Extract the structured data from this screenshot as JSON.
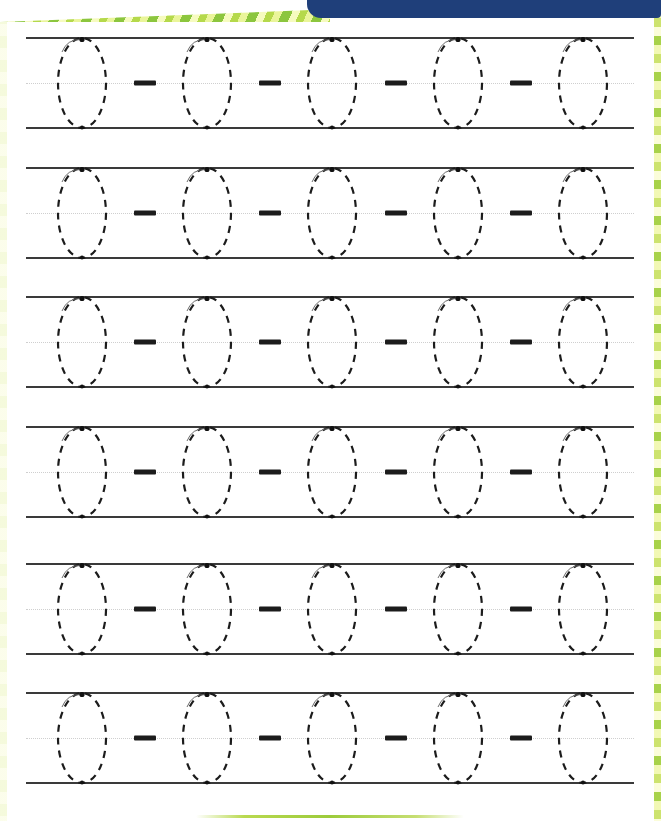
{
  "document": {
    "type": "handwriting-tracing-worksheet",
    "letter": "O",
    "title": "",
    "instructions": "",
    "rows_count": 6,
    "letters_per_row": 5,
    "separators_per_row": 4
  },
  "decor": {
    "top_stripe_colors": [
      "#8cc63e",
      "#eaf59a",
      "#b5d94b",
      "#f6fbbf"
    ],
    "banner_color": "#1f3f7a",
    "edge_left_colors": [
      "#fbfde8",
      "#f3f9d6"
    ],
    "edge_right_colors": [
      "#a8d24a",
      "#f2f8b4",
      "#cde36e",
      "#fbfdd9"
    ],
    "bottom_accent_color": "#9ccb3b"
  },
  "guides": {
    "top_line_color": "#3a3a3a",
    "bottom_line_color": "#3a3a3a",
    "middle_line_color": "#cfcfcf",
    "middle_line_style": "dotted"
  },
  "glyph": {
    "stroke_color": "#1c1c1c",
    "dash_pattern": "7 6",
    "start_dot_color": "#111111",
    "arrow_color": "#6b6b6b",
    "separator_color": "#1c1c1c"
  },
  "rows": [
    {
      "index": 1,
      "top": 37,
      "bottom": 129,
      "letters": [
        {
          "cx": 82
        },
        {
          "cx": 207
        },
        {
          "cx": 332
        },
        {
          "cx": 458
        },
        {
          "cx": 583
        }
      ],
      "separators": [
        {
          "cx": 145
        },
        {
          "cx": 270
        },
        {
          "cx": 396
        },
        {
          "cx": 521
        }
      ]
    },
    {
      "index": 2,
      "top": 167,
      "bottom": 259,
      "letters": [
        {
          "cx": 82
        },
        {
          "cx": 207
        },
        {
          "cx": 332
        },
        {
          "cx": 458
        },
        {
          "cx": 583
        }
      ],
      "separators": [
        {
          "cx": 145
        },
        {
          "cx": 270
        },
        {
          "cx": 396
        },
        {
          "cx": 521
        }
      ]
    },
    {
      "index": 3,
      "top": 296,
      "bottom": 388,
      "letters": [
        {
          "cx": 82
        },
        {
          "cx": 207
        },
        {
          "cx": 332
        },
        {
          "cx": 458
        },
        {
          "cx": 583
        }
      ],
      "separators": [
        {
          "cx": 145
        },
        {
          "cx": 270
        },
        {
          "cx": 396
        },
        {
          "cx": 521
        }
      ]
    },
    {
      "index": 4,
      "top": 426,
      "bottom": 518,
      "letters": [
        {
          "cx": 82
        },
        {
          "cx": 207
        },
        {
          "cx": 332
        },
        {
          "cx": 458
        },
        {
          "cx": 583
        }
      ],
      "separators": [
        {
          "cx": 145
        },
        {
          "cx": 270
        },
        {
          "cx": 396
        },
        {
          "cx": 521
        }
      ]
    },
    {
      "index": 5,
      "top": 563,
      "bottom": 655,
      "letters": [
        {
          "cx": 82
        },
        {
          "cx": 207
        },
        {
          "cx": 332
        },
        {
          "cx": 458
        },
        {
          "cx": 583
        }
      ],
      "separators": [
        {
          "cx": 145
        },
        {
          "cx": 270
        },
        {
          "cx": 396
        },
        {
          "cx": 521
        }
      ]
    },
    {
      "index": 6,
      "top": 692,
      "bottom": 784,
      "letters": [
        {
          "cx": 82
        },
        {
          "cx": 207
        },
        {
          "cx": 332
        },
        {
          "cx": 458
        },
        {
          "cx": 583
        }
      ],
      "separators": [
        {
          "cx": 145
        },
        {
          "cx": 270
        },
        {
          "cx": 396
        },
        {
          "cx": 521
        }
      ]
    }
  ]
}
